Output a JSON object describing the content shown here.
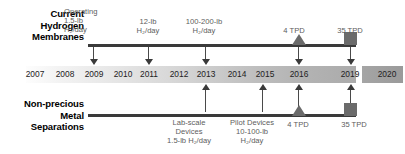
{
  "rows": {
    "top": {
      "title_lines": [
        "Current",
        "Hydrogen",
        "Membranes"
      ],
      "callouts": [
        {
          "lines": [
            "Operating",
            "1.5-lb",
            "H₂/day"
          ],
          "year": "2009"
        },
        {
          "lines": [
            "12-lb",
            "H₂/day"
          ],
          "year": "2011"
        },
        {
          "lines": [
            "100-200-lb",
            "H₂/day"
          ],
          "year": "2013"
        },
        {
          "lines": [
            "4 TPD"
          ],
          "year": "2016",
          "marker": "triangle"
        },
        {
          "lines": [
            "35 TPD"
          ],
          "year": "2020",
          "marker": "square"
        }
      ]
    },
    "bottom": {
      "title_lines": [
        "Non-precious",
        "Metal",
        "Separations"
      ],
      "callouts": [
        {
          "lines": [
            "Lab-scale",
            "Devices",
            "1.5-lb H₂/day"
          ],
          "year": "2013"
        },
        {
          "lines": [
            "Pilot Devices",
            "10-100-lb",
            "H₂/day"
          ],
          "year": "2015"
        },
        {
          "lines": [
            "4 TPD"
          ],
          "year": "2016",
          "marker": "triangle"
        },
        {
          "lines": [
            "35 TPD"
          ],
          "year": "2020",
          "marker": "square"
        }
      ]
    }
  },
  "timeline": {
    "years": [
      "2007",
      "2008",
      "2009",
      "2010",
      "2011",
      "2012",
      "2013",
      "2014",
      "2015",
      "2016",
      "2019",
      "2020"
    ],
    "gap_after": "2016"
  },
  "colors": {
    "line": "#3a3a3a",
    "marker": "#6b6b6b",
    "callout_text": "#5d5d5d",
    "title_text": "#000000",
    "band_light": "#fdfdfd",
    "band_dark": "#9a9a9a"
  }
}
